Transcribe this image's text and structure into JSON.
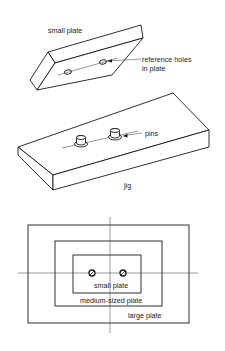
{
  "figure": {
    "top_view": {
      "plate_label": "small plate",
      "holes_label_line1": "reference holes",
      "holes_label_line2": "in plate"
    },
    "jig_view": {
      "pins_label": "pins",
      "jig_label": "jig"
    },
    "plan_view": {
      "small_plate_label": "small plate",
      "medium_plate_label": "medium-sized plate",
      "large_plate_label": "large plate"
    }
  },
  "colors": {
    "line": "#1a1a1a",
    "background": "#ffffff"
  }
}
